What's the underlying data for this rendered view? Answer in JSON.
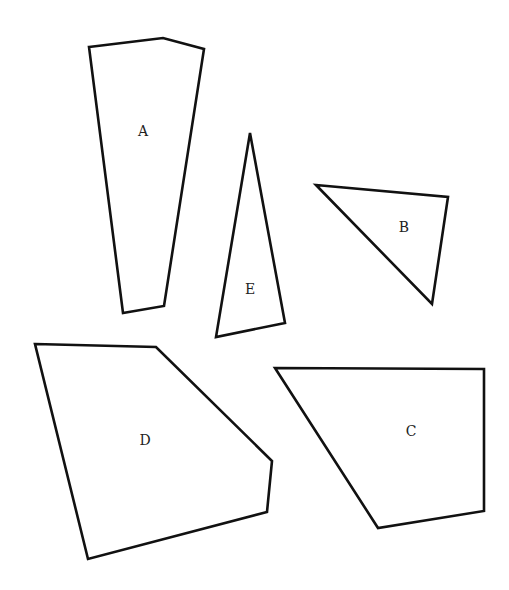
{
  "diagram": {
    "width": 509,
    "height": 590,
    "background": "#ffffff",
    "stroke_color": "#111111",
    "shapes": [
      {
        "id": "A",
        "label": "A",
        "type": "pentagon",
        "points": [
          [
            89,
            47
          ],
          [
            163,
            38
          ],
          [
            204,
            49
          ],
          [
            164,
            306
          ],
          [
            123,
            313
          ]
        ],
        "label_pos": [
          143,
          132
        ]
      },
      {
        "id": "B",
        "label": "B",
        "type": "triangle",
        "points": [
          [
            316,
            185
          ],
          [
            448,
            197
          ],
          [
            432,
            304
          ]
        ],
        "label_pos": [
          404,
          228
        ]
      },
      {
        "id": "C",
        "label": "C",
        "type": "quadrilateral",
        "points": [
          [
            275,
            368
          ],
          [
            484,
            369
          ],
          [
            484,
            511
          ],
          [
            378,
            528
          ]
        ],
        "label_pos": [
          411,
          432
        ]
      },
      {
        "id": "D",
        "label": "D",
        "type": "pentagon",
        "points": [
          [
            35,
            344
          ],
          [
            156,
            347
          ],
          [
            272,
            461
          ],
          [
            267,
            512
          ],
          [
            88,
            559
          ]
        ],
        "label_pos": [
          145,
          441
        ]
      },
      {
        "id": "E",
        "label": "E",
        "type": "triangle",
        "points": [
          [
            250,
            133
          ],
          [
            285,
            323
          ],
          [
            216,
            337
          ]
        ],
        "label_pos": [
          250,
          290
        ]
      }
    ]
  }
}
